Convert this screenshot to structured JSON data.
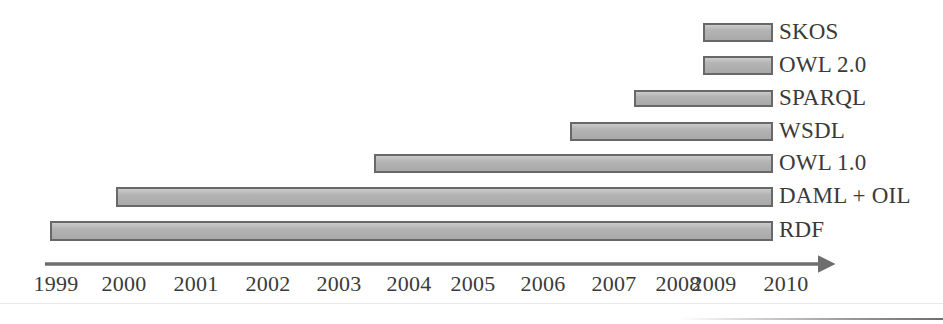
{
  "chart_data": {
    "type": "bar",
    "orientation": "horizontal",
    "subtype": "timeline-gantt",
    "title": "",
    "subtitle": "",
    "xlabel": "",
    "ylabel": "",
    "xlim": [
      1999,
      2010.6
    ],
    "grid": false,
    "legend": "none",
    "axis": {
      "tick_labels": [
        "1999",
        "2000",
        "2001",
        "2002",
        "2003",
        "2004",
        "2005",
        "2006",
        "2007",
        "2008",
        "2009",
        "2010"
      ],
      "tick_values": [
        1999,
        2000,
        2001,
        2002,
        2003,
        2004,
        2005,
        2006,
        2007,
        2008,
        2009,
        2010
      ],
      "arrow": true,
      "line_color": "#6e6e6e"
    },
    "categories": [
      "SKOS",
      "OWL 2.0",
      "SPARQL",
      "WSDL",
      "OWL 1.0",
      "DAML + OIL",
      "RDF"
    ],
    "series": [
      {
        "name": "Standard lifespan",
        "bars": [
          {
            "label": "SKOS",
            "start": 2008.9,
            "end": 2010.4
          },
          {
            "label": "OWL 2.0",
            "start": 2008.9,
            "end": 2010.4
          },
          {
            "label": "SPARQL",
            "start": 2007.9,
            "end": 2010.4
          },
          {
            "label": "WSDL",
            "start": 2007.1,
            "end": 2010.4
          },
          {
            "label": "OWL 1.0",
            "start": 2003.4,
            "end": 2010.4
          },
          {
            "label": "DAML + OIL",
            "start": 1999.8,
            "end": 2010.4
          },
          {
            "label": "RDF",
            "start": 1999.0,
            "end": 2010.4
          }
        ]
      }
    ],
    "colors": {
      "bar_fill": "#b0b0b0",
      "bar_border": "#686868",
      "text": "#3a3a3a",
      "axis": "#6e6e6e",
      "background": "#ffffff"
    }
  },
  "bars": [
    {
      "label": "SKOS",
      "left": 703,
      "width": 70,
      "top": 23,
      "height": 19
    },
    {
      "label": "OWL 2.0",
      "left": 703,
      "width": 70,
      "top": 56,
      "height": 19
    },
    {
      "label": "SPARQL",
      "left": 634,
      "width": 139,
      "top": 90,
      "height": 17
    },
    {
      "label": "WSDL",
      "left": 570,
      "width": 203,
      "top": 122,
      "height": 19
    },
    {
      "label": "OWL 1.0",
      "left": 374,
      "width": 399,
      "top": 154,
      "height": 19
    },
    {
      "label": "DAML + OIL",
      "left": 116,
      "width": 657,
      "top": 187,
      "height": 20
    },
    {
      "label": "RDF",
      "left": 50,
      "width": 723,
      "top": 221,
      "height": 20
    }
  ],
  "bar_labels": [
    {
      "text": "SKOS",
      "x": 779,
      "y": 20
    },
    {
      "text": "OWL 2.0",
      "x": 779,
      "y": 53
    },
    {
      "text": "SPARQL",
      "x": 779,
      "y": 86
    },
    {
      "text": "WSDL",
      "x": 779,
      "y": 119
    },
    {
      "text": "OWL 1.0",
      "x": 779,
      "y": 151
    },
    {
      "text": "DAML + OIL",
      "x": 779,
      "y": 184
    },
    {
      "text": "RDF",
      "x": 779,
      "y": 218
    }
  ],
  "ticks": [
    {
      "text": "1999",
      "x": 56
    },
    {
      "text": "2000",
      "x": 124
    },
    {
      "text": "2001",
      "x": 196
    },
    {
      "text": "2002",
      "x": 268
    },
    {
      "text": "2003",
      "x": 339
    },
    {
      "text": "2004",
      "x": 409
    },
    {
      "text": "2005",
      "x": 473
    },
    {
      "text": "2006",
      "x": 543
    },
    {
      "text": "2007",
      "x": 614
    },
    {
      "text": "2008",
      "x": 678
    },
    {
      "text": "2009",
      "x": 714
    },
    {
      "text": "2010",
      "x": 786
    }
  ]
}
